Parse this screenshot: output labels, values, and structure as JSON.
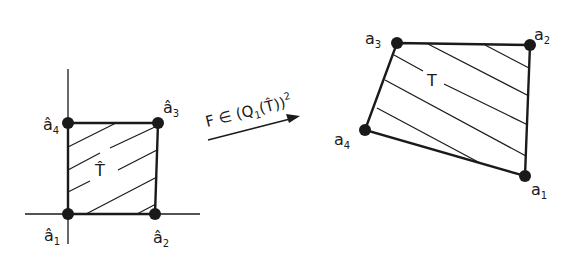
{
  "diagram": {
    "type": "bilinear-mapping",
    "reference_element": {
      "label": "T̂",
      "vertices": [
        {
          "id": "a1",
          "name": "â",
          "sub": "1"
        },
        {
          "id": "a2",
          "name": "â",
          "sub": "2"
        },
        {
          "id": "a3",
          "name": "â",
          "sub": "3"
        },
        {
          "id": "a4",
          "name": "â",
          "sub": "4"
        }
      ]
    },
    "mapping": {
      "prefix": "F ∈ (Q",
      "sub": "1",
      "middle": "(T̂))",
      "sup": "2"
    },
    "target_element": {
      "label": "T",
      "vertices": [
        {
          "id": "a1",
          "name": "a",
          "sub": "1"
        },
        {
          "id": "a2",
          "name": "a",
          "sub": "2"
        },
        {
          "id": "a3",
          "name": "a",
          "sub": "3"
        },
        {
          "id": "a4",
          "name": "a",
          "sub": "4"
        }
      ]
    },
    "colors": {
      "ink": "#1a1a1a",
      "background": "#ffffff"
    }
  }
}
